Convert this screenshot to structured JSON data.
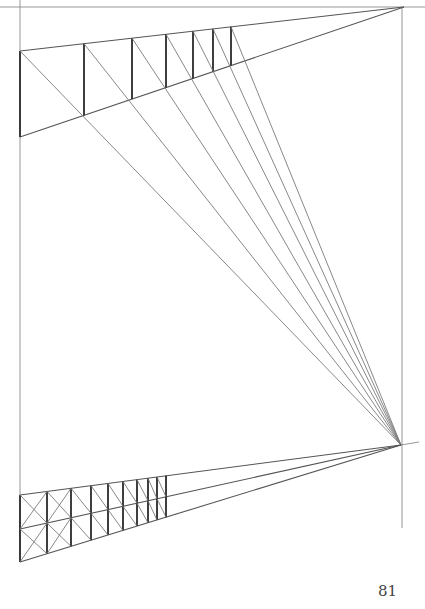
{
  "page": {
    "number": "81"
  },
  "drawing": {
    "title": "perspective-construction",
    "vanishing_points": {
      "upper": [
        404,
        7
      ],
      "lower": [
        401,
        445
      ]
    },
    "horizon_line": {
      "x1": 0,
      "x2": 425,
      "y": 7
    },
    "left_guide": {
      "x": 20,
      "y1": 0,
      "y2": 560
    },
    "right_guide": {
      "x": 402,
      "y1": 7,
      "y2": 528
    },
    "upper_fence": {
      "left_top": [
        20,
        51
      ],
      "left_bottom": [
        20,
        137
      ],
      "posts_x": [
        20,
        84,
        132,
        166,
        193,
        213,
        231
      ]
    },
    "lower_fence": {
      "left_top": [
        20,
        495
      ],
      "left_mid": [
        20,
        529
      ],
      "left_bottom": [
        20,
        562
      ],
      "posts_x": [
        20,
        47,
        71,
        91,
        108,
        123,
        137,
        148,
        157,
        166
      ]
    }
  }
}
